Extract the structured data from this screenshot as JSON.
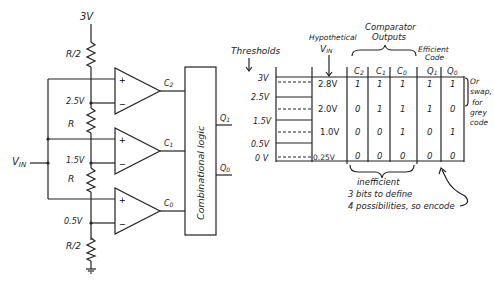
{
  "circuit": {
    "supply_label": "3V",
    "resistors": [
      {
        "label": "R/2",
        "position": "top"
      },
      {
        "label": "R",
        "position": "upper-mid"
      },
      {
        "label": "R",
        "position": "lower-mid"
      },
      {
        "label": "R/2",
        "position": "bottom"
      }
    ],
    "node_voltages": [
      "2.5V",
      "1.5V",
      "0.5V"
    ],
    "input_label": "VIN",
    "input_main": "V",
    "input_sub": "IN",
    "comparators": [
      {
        "name": "C2",
        "main": "C",
        "sub": "2",
        "plus": "+",
        "minus": "−"
      },
      {
        "name": "C1",
        "main": "C",
        "sub": "1",
        "plus": "+",
        "minus": "−"
      },
      {
        "name": "C0",
        "main": "C",
        "sub": "0",
        "plus": "+",
        "minus": "−"
      }
    ],
    "logic_block_label": "Combinational logic",
    "outputs": [
      {
        "main": "Q",
        "sub": "1"
      },
      {
        "main": "Q",
        "sub": "0"
      }
    ]
  },
  "table": {
    "thresholds_title": "Thresholds",
    "threshold_levels": [
      "3V",
      "2.5V",
      "1.5V",
      "0.5V",
      "0 V"
    ],
    "vin_title_line1": "Hypothetical",
    "vin_title_main": "V",
    "vin_title_sub": "IN",
    "comparator_group_title_line1": "Comparator",
    "comparator_group_title_line2": "Outputs",
    "efficient_title_line1": "Efficient",
    "efficient_title_line2": "Code",
    "columns": [
      {
        "main": "C",
        "sub": "2"
      },
      {
        "main": "C",
        "sub": "1"
      },
      {
        "main": "C",
        "sub": "0"
      },
      {
        "main": "Q",
        "sub": "1"
      },
      {
        "main": "Q",
        "sub": "0"
      }
    ],
    "rows": [
      {
        "vin": "2.8V",
        "c2": "1",
        "c1": "1",
        "c0": "1",
        "q1": "1",
        "q0": "1"
      },
      {
        "vin": "2.0V",
        "c2": "0",
        "c1": "1",
        "c0": "1",
        "q1": "1",
        "q0": "0"
      },
      {
        "vin": "1.0V",
        "c2": "0",
        "c1": "0",
        "c0": "1",
        "q1": "0",
        "q0": "1"
      },
      {
        "vin": "0.25V",
        "c2": "0",
        "c1": "0",
        "c0": "0",
        "q1": "0",
        "q0": "0"
      }
    ],
    "side_note": [
      "Or",
      "swap,",
      "for",
      "grey",
      "code"
    ],
    "bottom_note": {
      "line1": "inefficient",
      "line2": "3 bits to define",
      "line3": "4 possibilities, so encode"
    }
  }
}
